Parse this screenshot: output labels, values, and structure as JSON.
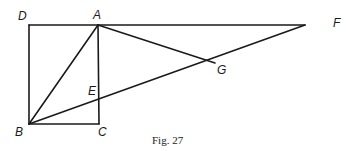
{
  "figure": {
    "caption": "Fig. 27",
    "stroke_color": "#1a1a1a",
    "points": {
      "D": {
        "label": "D",
        "x": 29,
        "y": 25
      },
      "A": {
        "label": "A",
        "x": 98,
        "y": 25
      },
      "F": {
        "label": "F",
        "x": 305,
        "y": 25
      },
      "B": {
        "label": "B",
        "x": 29,
        "y": 124
      },
      "C": {
        "label": "C",
        "x": 99,
        "y": 124
      },
      "E": {
        "label": "E",
        "x": 99,
        "y": 100
      },
      "G": {
        "label": "G",
        "x": 215,
        "y": 63
      }
    },
    "segments": [
      [
        "D",
        "F"
      ],
      [
        "D",
        "B"
      ],
      [
        "B",
        "C"
      ],
      [
        "A",
        "C"
      ],
      [
        "A",
        "B"
      ],
      [
        "B",
        "F"
      ],
      [
        "A",
        "G"
      ]
    ]
  }
}
